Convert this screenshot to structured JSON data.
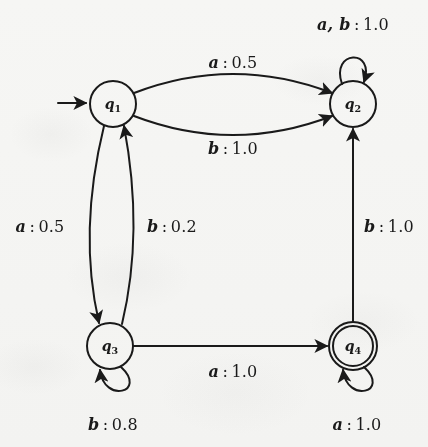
{
  "figure": {
    "type": "state-transition-diagram",
    "name": "probabilistic-finite-automaton",
    "alphabet": [
      "a",
      "b"
    ],
    "start_state": "q1",
    "accepting_states": [
      "q4"
    ]
  },
  "states": [
    {
      "id": "q1",
      "name": "q",
      "index": "1",
      "accepting": false,
      "start": true,
      "cx": 113,
      "cy": 104,
      "r": 23
    },
    {
      "id": "q2",
      "name": "q",
      "index": "2",
      "accepting": false,
      "start": false,
      "cx": 353,
      "cy": 104,
      "r": 23
    },
    {
      "id": "q3",
      "name": "q",
      "index": "3",
      "accepting": false,
      "start": false,
      "cx": 110,
      "cy": 346,
      "r": 23
    },
    {
      "id": "q4",
      "name": "q",
      "index": "4",
      "accepting": true,
      "start": false,
      "cx": 353,
      "cy": 346,
      "r": 24
    }
  ],
  "transitions": [
    {
      "id": "t-q1-q2-a",
      "from": "q1",
      "to": "q2",
      "symbol": "a",
      "probability": "0.5",
      "label": "a : 0.5",
      "label_x": 233,
      "label_y": 62,
      "shape": "curve-up"
    },
    {
      "id": "t-q1-q2-b",
      "from": "q1",
      "to": "q2",
      "symbol": "b",
      "probability": "1.0",
      "label": "b : 1.0",
      "label_x": 233,
      "label_y": 148,
      "shape": "curve-down"
    },
    {
      "id": "t-q2-q2-ab",
      "from": "q2",
      "to": "q2",
      "symbol": "a, b",
      "probability": "1.0",
      "label": "a, b : 1.0",
      "label_x": 353,
      "label_y": 24,
      "shape": "self-loop-top"
    },
    {
      "id": "t-q1-q3-a",
      "from": "q1",
      "to": "q3",
      "symbol": "a",
      "probability": "0.5",
      "label": "a : 0.5",
      "label_x": 40,
      "label_y": 226,
      "shape": "curve-left"
    },
    {
      "id": "t-q3-q1-b",
      "from": "q3",
      "to": "q1",
      "symbol": "b",
      "probability": "0.2",
      "label": "b : 0.2",
      "label_x": 172,
      "label_y": 226,
      "shape": "curve-right"
    },
    {
      "id": "t-q4-q2-b",
      "from": "q4",
      "to": "q2",
      "symbol": "b",
      "probability": "1.0",
      "label": "b : 1.0",
      "label_x": 389,
      "label_y": 226,
      "shape": "straight-up"
    },
    {
      "id": "t-q3-q4-a",
      "from": "q3",
      "to": "q4",
      "symbol": "a",
      "probability": "1.0",
      "label": "a : 1.0",
      "label_x": 233,
      "label_y": 371,
      "shape": "straight-right"
    },
    {
      "id": "t-q3-q3-b",
      "from": "q3",
      "to": "q3",
      "symbol": "b",
      "probability": "0.8",
      "label": "b : 0.8",
      "label_x": 113,
      "label_y": 424,
      "shape": "self-loop-bottom"
    },
    {
      "id": "t-q4-q4-a",
      "from": "q4",
      "to": "q4",
      "symbol": "a",
      "probability": "1.0",
      "label": "a : 1.0",
      "label_x": 357,
      "label_y": 424,
      "shape": "self-loop-bottom"
    }
  ],
  "colors": {
    "ink": "#1a1a1a",
    "paper": "#fbfbfa"
  }
}
